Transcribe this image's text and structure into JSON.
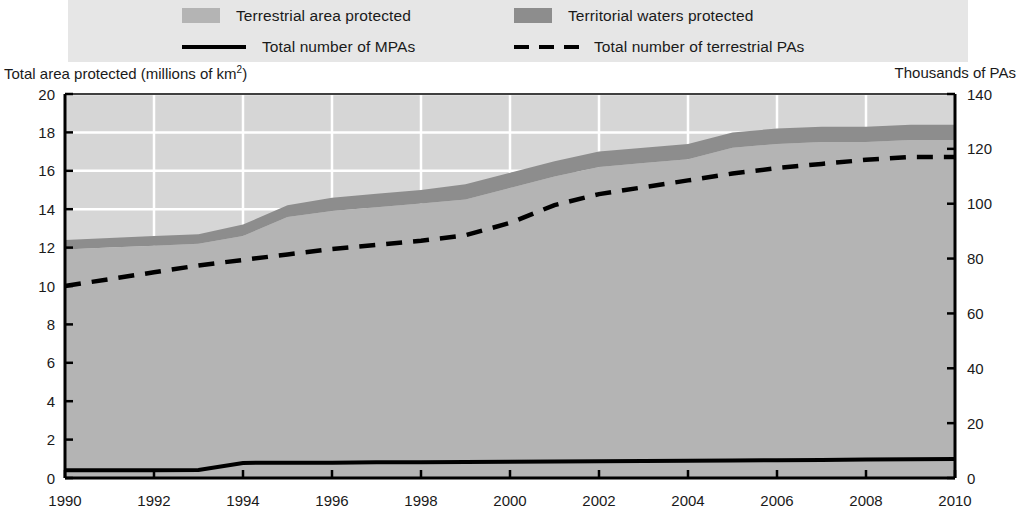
{
  "legend": {
    "entries": [
      {
        "label": "Terrestrial area protected",
        "type": "swatch",
        "color": "#b4b4b4"
      },
      {
        "label": "Territorial waters protected",
        "type": "swatch",
        "color": "#8d8d8d"
      },
      {
        "label": "Total number of MPAs",
        "type": "solid-line",
        "color": "#000000"
      },
      {
        "label": "Total number of terrestrial PAs",
        "type": "dashed-line",
        "color": "#000000"
      }
    ],
    "background": "#e6e6e6"
  },
  "axis_captions": {
    "left": "Total area protected (millions of km",
    "left_superscript": "2",
    "left_close": ")",
    "right": "Thousands of PAs"
  },
  "chart_data": {
    "type": "area",
    "title": "",
    "subtitle": "",
    "xlabel": "",
    "ylabel": "Total area protected (millions of km2)",
    "y2label": "Thousands of PAs",
    "xlim": [
      1990,
      2010
    ],
    "ylim": [
      0,
      20
    ],
    "y2lim": [
      0,
      140
    ],
    "grid": true,
    "grid_color": "#ffffff",
    "plot_background": "#d6d6d6",
    "legend_position": "top",
    "x": [
      1990,
      1991,
      1992,
      1993,
      1994,
      1995,
      1996,
      1997,
      1998,
      1999,
      2000,
      2001,
      2002,
      2003,
      2004,
      2005,
      2006,
      2007,
      2008,
      2009,
      2010
    ],
    "xticks": [
      1990,
      1992,
      1994,
      1996,
      1998,
      2000,
      2002,
      2004,
      2006,
      2008,
      2010
    ],
    "xticklabels": [
      "1990",
      "1992",
      "1994",
      "1996",
      "1998",
      "2000",
      "2002",
      "2004",
      "2006",
      "2008",
      "2010"
    ],
    "yticks": [
      0,
      2,
      4,
      6,
      8,
      10,
      12,
      14,
      16,
      18,
      20
    ],
    "yticklabels": [
      "0",
      "2",
      "4",
      "6",
      "8",
      "10",
      "12",
      "14",
      "16",
      "18",
      "20"
    ],
    "y2ticks": [
      0,
      20,
      40,
      60,
      80,
      100,
      120,
      140
    ],
    "y2ticklabels": [
      "0",
      "20",
      "40",
      "60",
      "80",
      "100",
      "120",
      "140"
    ],
    "series": [
      {
        "name": "Terrestrial area protected",
        "kind": "stacked-area",
        "axis": "left",
        "color": "#b4b4b4",
        "units": "millions of km2",
        "values": [
          11.9,
          12.0,
          12.1,
          12.2,
          12.6,
          13.6,
          13.9,
          14.1,
          14.3,
          14.5,
          15.1,
          15.7,
          16.2,
          16.4,
          16.6,
          17.2,
          17.4,
          17.5,
          17.5,
          17.6,
          17.6
        ]
      },
      {
        "name": "Territorial waters protected",
        "kind": "stacked-area",
        "axis": "left",
        "color": "#8d8d8d",
        "units": "millions of km2",
        "values": [
          0.5,
          0.5,
          0.5,
          0.5,
          0.6,
          0.6,
          0.7,
          0.7,
          0.7,
          0.8,
          0.8,
          0.8,
          0.8,
          0.8,
          0.8,
          0.8,
          0.8,
          0.8,
          0.8,
          0.8,
          0.8
        ]
      },
      {
        "name": "Total area protected",
        "kind": "stack-total",
        "axis": "left",
        "units": "millions of km2",
        "values": [
          12.4,
          12.5,
          12.6,
          12.7,
          13.2,
          14.2,
          14.6,
          14.8,
          15.0,
          15.3,
          15.9,
          16.5,
          17.0,
          17.2,
          17.4,
          18.0,
          18.2,
          18.3,
          18.3,
          18.4,
          18.4
        ]
      },
      {
        "name": "Total number of MPAs",
        "kind": "solid-line",
        "axis": "right",
        "color": "#000000",
        "units": "thousands",
        "values": [
          2.8,
          2.8,
          2.8,
          2.9,
          5.5,
          5.6,
          5.6,
          5.7,
          5.7,
          5.8,
          5.9,
          6.0,
          6.1,
          6.2,
          6.3,
          6.4,
          6.5,
          6.6,
          6.7,
          6.8,
          6.9
        ]
      },
      {
        "name": "Total number of terrestrial PAs",
        "kind": "dashed-line",
        "axis": "right",
        "color": "#000000",
        "units": "thousands",
        "values": [
          70.0,
          72.5,
          75.0,
          77.5,
          79.5,
          81.5,
          83.5,
          85.0,
          86.5,
          88.5,
          93.0,
          99.5,
          103.5,
          106.0,
          108.5,
          111.0,
          113.0,
          114.5,
          116.0,
          117.0,
          117.0
        ]
      }
    ]
  }
}
